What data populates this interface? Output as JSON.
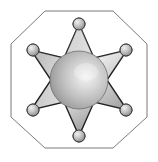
{
  "image": {
    "title": "Sheriff Star Badge",
    "subject": "six-pointed sheriff badge inside octagonal frame",
    "width": 158,
    "height": 162,
    "background_color": "#ffffff"
  },
  "frame": {
    "name": "octagon-outline",
    "shape": "octagon",
    "stroke_color": "#7b7b7b",
    "stroke_width": 1,
    "fill": "none",
    "points": "45,11 113,11 147,44 147,117 113,148 45,148 11,117 11,44",
    "bounds": {
      "left": 11,
      "top": 11,
      "right": 147,
      "bottom": 148
    }
  },
  "star": {
    "name": "six-pointed-star",
    "points_count": 6,
    "outline_color": "#1c1c1c",
    "outline_width": 1.4,
    "fill_light": "#e4e4e4",
    "fill_mid": "#b4b4b4",
    "fill_dark": "#707070",
    "center": {
      "x": 79,
      "y": 80
    },
    "outer_radius": 56,
    "inner_radius": 27,
    "polygon": "79,24 94,58 127,50 107,80 127,110 94,102 79,136 64,102 31,110 51,80 31,50 64,58"
  },
  "sphere": {
    "name": "center-sphere",
    "center": {
      "x": 79,
      "y": 80
    },
    "radius": 29,
    "highlight": {
      "x": 86,
      "y": 72
    },
    "color_highlight": "#f2f2f2",
    "color_mid": "#bdbdbd",
    "color_shadow": "#8a8a8a",
    "outline_color": "#6f6f6f"
  },
  "tip_balls": {
    "name": "star-tip-balls",
    "radius": 6,
    "fill_light": "#ededed",
    "fill_mid": "#bcbcbc",
    "fill_dark": "#8c8c8c",
    "outline_color": "#3a3a3a",
    "positions": [
      {
        "id": "ball-top",
        "label": "top point",
        "x": 79,
        "y": 24
      },
      {
        "id": "ball-upper-right",
        "label": "upper right point",
        "x": 126,
        "y": 50
      },
      {
        "id": "ball-lower-right",
        "label": "lower right point",
        "x": 126,
        "y": 110
      },
      {
        "id": "ball-bottom",
        "label": "bottom point",
        "x": 79,
        "y": 136
      },
      {
        "id": "ball-lower-left",
        "label": "lower left point",
        "x": 33,
        "y": 110
      },
      {
        "id": "ball-upper-left",
        "label": "upper left point",
        "x": 33,
        "y": 50
      }
    ]
  }
}
